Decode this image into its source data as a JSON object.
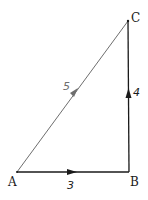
{
  "diagram": {
    "type": "vector-triangle",
    "points": {
      "A": {
        "label": "A",
        "x": 17,
        "y": 172
      },
      "B": {
        "label": "B",
        "x": 129,
        "y": 172
      },
      "C": {
        "label": "C",
        "x": 128,
        "y": 21
      }
    },
    "edges": [
      {
        "from": "A",
        "to": "B",
        "magnitude_label": "3",
        "color": "#1a1a1a"
      },
      {
        "from": "B",
        "to": "C",
        "magnitude_label": "4",
        "color": "#1a1a1a"
      },
      {
        "from": "A",
        "to": "C",
        "magnitude_label": "5",
        "color": "#6e6e6e"
      }
    ],
    "colors": {
      "primary": "#1a1a1a",
      "hypotenuse": "#6e6e6e"
    }
  }
}
